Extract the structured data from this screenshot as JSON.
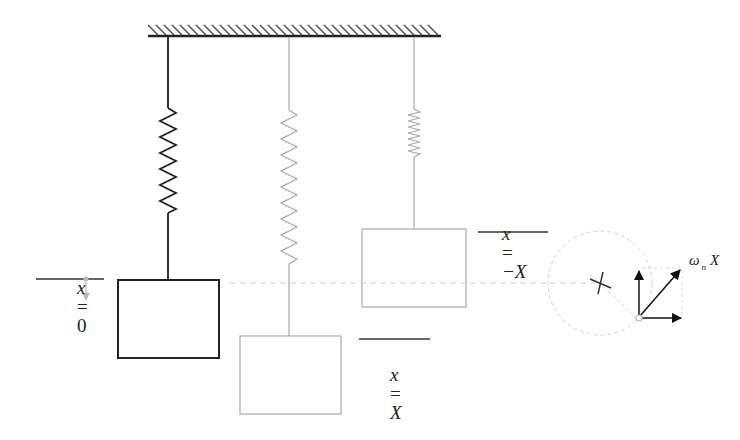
{
  "diagram": {
    "colors": {
      "background": "#ffffff",
      "ink_dark": "#222222",
      "ink_light": "#9a9a9a",
      "dashed": "#c8c8c8"
    },
    "ground": {
      "x1": 148,
      "x2": 441,
      "y": 36,
      "hatch": "ground-hatch"
    },
    "springs": [
      {
        "id": "equilibrium",
        "x": 168,
        "state": "x = 0",
        "style": "dark"
      },
      {
        "id": "stretched",
        "x": 289,
        "state": "x = X",
        "style": "light"
      },
      {
        "id": "compressed",
        "x": 414,
        "state": "x = -X",
        "style": "light"
      }
    ],
    "labels": {
      "x_zero": {
        "var": "x",
        "eq": "=",
        "val": "0"
      },
      "x_pos": {
        "var": "x",
        "eq": "=",
        "val": "X"
      },
      "x_neg": {
        "var": "x",
        "eq": "=",
        "val": "−X"
      },
      "omega": {
        "sym": "ω",
        "sub": "n",
        "var": "X"
      }
    },
    "phasor": {
      "center": [
        600,
        283
      ],
      "radius": 52,
      "tip": [
        636,
        318
      ],
      "components": [
        "vertical",
        "horizontal",
        "resultant"
      ]
    }
  }
}
